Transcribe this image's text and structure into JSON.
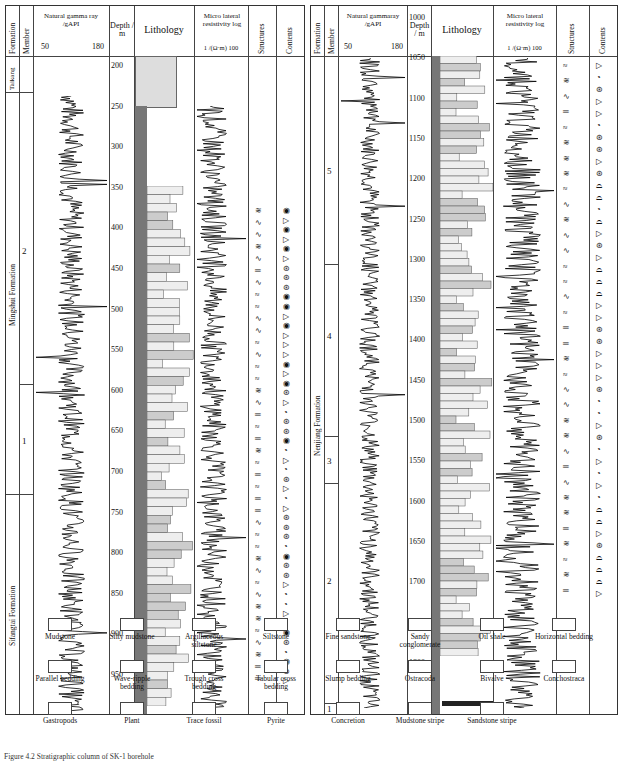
{
  "left_panel": {
    "headers": {
      "formation": "Formation",
      "member": "Member",
      "gamma": "Natural gamma ray /gAPI",
      "gamma_min": "50",
      "gamma_max": "180",
      "depth": "Depth / m",
      "lithology": "Lithology",
      "resistivity": "Micro lateral resistivity log",
      "res_unit": "1 /(Ω·m) 100",
      "structures": "Structures",
      "contents": "Contents"
    },
    "formations": [
      {
        "name": "Taikang",
        "top": 197,
        "bottom": 225
      },
      {
        "name": "Mingshui Formation",
        "top": 225,
        "bottom": 664
      },
      {
        "name": "Sifangtai Formation",
        "top": 664,
        "bottom": 985
      }
    ],
    "members": [
      {
        "name": "2",
        "top": 225,
        "bottom": 620
      },
      {
        "name": "1",
        "top": 620,
        "bottom": 664
      }
    ],
    "depth_ticks": [
      "200",
      "250",
      "300",
      "350",
      "400",
      "450",
      "500",
      "550",
      "600",
      "650",
      "700",
      "750",
      "800",
      "850",
      "900",
      "950"
    ]
  },
  "right_panel": {
    "headers": {
      "formation": "Formation",
      "member": "Member",
      "gamma": "Natural gammaray /gAPI",
      "gamma_min": "50",
      "gamma_max": "180",
      "depth": "Depth / m",
      "lithology": "Lithology",
      "resistivity": "Micro lateral resistivity log",
      "res_unit": "1 /(Ω·m) 100",
      "structures": "Structures",
      "contents": "Contents"
    },
    "formations": [
      {
        "name": "Nenjiang Formation",
        "top": 995,
        "bottom": 1805
      }
    ],
    "members": [
      {
        "name": "5",
        "top": 995,
        "bottom": 1260
      },
      {
        "name": "4",
        "top": 1260,
        "bottom": 1480
      },
      {
        "name": "3",
        "top": 1480,
        "bottom": 1590
      },
      {
        "name": "2",
        "top": 1590,
        "bottom": 1790
      },
      {
        "name": "1",
        "top": 1790,
        "bottom": 1805
      }
    ],
    "depth_ticks": [
      "1000",
      "1050",
      "1100",
      "1150",
      "1200",
      "1250",
      "1300",
      "1350",
      "1400",
      "1450",
      "1500",
      "1550",
      "1600",
      "1650",
      "1700",
      "1750",
      "1800"
    ]
  },
  "legend": [
    {
      "label": "Mudstone",
      "icon": "mudstone-pattern"
    },
    {
      "label": "Silty mudstone",
      "icon": "silty-mudstone-pattern"
    },
    {
      "label": "Argillaceous siltstone",
      "icon": "argillaceous-siltstone-pattern"
    },
    {
      "label": "Siltstone",
      "icon": "siltstone-pattern"
    },
    {
      "label": "Fine sandstone",
      "icon": "fine-sandstone-pattern"
    },
    {
      "label": "Sandy conglomerate",
      "icon": "sandy-conglomerate-pattern"
    },
    {
      "label": "Oil shale",
      "icon": "oil-shale-pattern"
    },
    {
      "label": "Horizontal bedding",
      "icon": "horizontal-bedding-icon"
    },
    {
      "label": "Parallel bedding",
      "icon": "parallel-bedding-icon"
    },
    {
      "label": "Wave-ripple bedding",
      "icon": "wave-ripple-icon"
    },
    {
      "label": "Trough cross bedding",
      "icon": "trough-cross-icon"
    },
    {
      "label": "Tabular cross bedding",
      "icon": "tabular-cross-icon"
    },
    {
      "label": "Slump bedding",
      "icon": "slump-bedding-icon"
    },
    {
      "label": "Ostracoda",
      "icon": "ostracoda-icon"
    },
    {
      "label": "Bivalve",
      "icon": "bivalve-icon"
    },
    {
      "label": "Conchostraca",
      "icon": "conchostraca-icon"
    },
    {
      "label": "Gastropods",
      "icon": "gastropod-icon"
    },
    {
      "label": "Plant",
      "icon": "plant-icon"
    },
    {
      "label": "Trace fossil",
      "icon": "trace-fossil-icon"
    },
    {
      "label": "Pyrite",
      "icon": "pyrite-icon"
    },
    {
      "label": "Concretion",
      "icon": "concretion-icon"
    },
    {
      "label": "Mudstone stripe",
      "icon": "mudstone-stripe-icon"
    },
    {
      "label": "Sandstone stripe",
      "icon": "sandstone-stripe-icon"
    }
  ],
  "caption": "Figure 4.2   Stratigraphic column of SK-1 borehole"
}
